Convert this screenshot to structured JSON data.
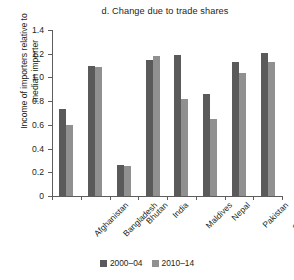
{
  "chart_data": {
    "type": "bar",
    "title": "d. Change due to trade shares",
    "xlabel": "",
    "ylabel": "Income of importers relative to median importer",
    "ylabel_lines": [
      "Income of importers relative to",
      "median importer"
    ],
    "categories": [
      "Afghanistan",
      "Bangladesh",
      "Bhutan",
      "India",
      "Maldives",
      "Nepal",
      "Pakistan",
      "Sri Lanka"
    ],
    "series": [
      {
        "name": "2000–04",
        "color": "#5a5a5a",
        "values": [
          0.73,
          1.1,
          0.26,
          1.15,
          1.19,
          0.86,
          1.13,
          1.21
        ]
      },
      {
        "name": "2010–14",
        "color": "#909090",
        "values": [
          0.6,
          1.09,
          0.25,
          1.18,
          0.82,
          0.65,
          1.04,
          1.13
        ]
      }
    ],
    "ylim": [
      0,
      1.4
    ],
    "ytick_values": [
      0,
      0.2,
      0.4,
      0.6,
      0.8,
      1.0,
      1.2,
      1.4
    ],
    "ytick_labels": [
      "0",
      "0.2",
      "0.4",
      "0.6",
      "0.8",
      "1.0",
      "1.2",
      "1.4"
    ],
    "grid": false,
    "legend_position": "bottom"
  },
  "legend": {
    "items": [
      {
        "label": "2000–04",
        "color": "#5a5a5a"
      },
      {
        "label": "2010–14",
        "color": "#909090"
      }
    ]
  },
  "colors": {
    "series_2000_04": "#5a5a5a",
    "series_2010_14": "#909090",
    "axis": "#5d5d5d",
    "text": "#231f20",
    "background": "#ffffff"
  }
}
